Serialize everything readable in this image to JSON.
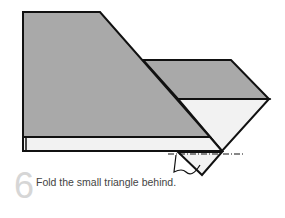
{
  "step": {
    "number": "6",
    "instruction": "Fold the small triangle behind."
  },
  "colors": {
    "paper_gray": "#a9a9a9",
    "paper_white": "#f2f2f2",
    "outline": "#111111",
    "step_number": "#d6d6d6",
    "caption_text": "#444444"
  },
  "diagram": {
    "type": "origami-fold-instruction",
    "fold_line": "dash-dot",
    "arrow": "fold-behind"
  }
}
